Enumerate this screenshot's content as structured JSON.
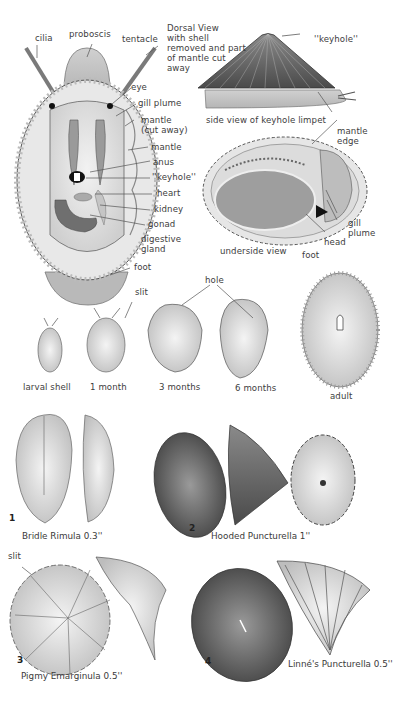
{
  "plate": {
    "anatomy": {
      "dorsal_caption": "Dorsal View\nwith shell\nremoved and part\nof mantle cut\naway",
      "labels": {
        "cilia": "cilia",
        "proboscis": "proboscis",
        "tentacle": "tentacle",
        "eye": "eye",
        "gill_plume": "gill plume",
        "mantle_cut": "mantle\n(cut away)",
        "mantle": "mantle",
        "anus": "anus",
        "keyhole": "''keyhole''",
        "heart": "heart",
        "kidney": "kidney",
        "gonad": "gonad",
        "digestive_gland": "digestive\ngland",
        "foot": "foot"
      }
    },
    "side_view": {
      "keyhole": "''keyhole''",
      "caption": "side view of keyhole limpet",
      "mantle_edge": "mantle\nedge"
    },
    "underside": {
      "caption": "underside view",
      "gill_plume": "gill\nplume",
      "head": "head",
      "foot": "foot"
    },
    "growth": {
      "slit": "slit",
      "hole": "hole",
      "stages": [
        "larval shell",
        "1 month",
        "3 months",
        "6 months",
        "adult"
      ]
    },
    "species": [
      {
        "number": "1",
        "name": "Bridle Rimula 0.3''"
      },
      {
        "number": "2",
        "name": "Hooded Puncturella 1''"
      },
      {
        "number": "3",
        "name": "Pigmy Emarginula 0.5''",
        "annotation": "slit"
      },
      {
        "number": "4",
        "name": "Linné's Puncturella 0.5''"
      }
    ],
    "colors": {
      "ink": "#3a3a3a",
      "shade_light": "#d8d8d8",
      "shade_mid": "#a8a8a8",
      "shade_dark": "#5a5a5a",
      "paper": "#ffffff"
    }
  }
}
